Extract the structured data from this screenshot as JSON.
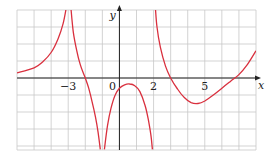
{
  "chart_data": {
    "type": "line",
    "title": "",
    "xlabel": "x",
    "ylabel": "y",
    "xlim": [
      -6,
      8
    ],
    "ylim": [
      -4.2,
      4
    ],
    "grid": true,
    "grid_step": 1,
    "x_tick_labels": [
      {
        "value": -3,
        "label": "−3"
      },
      {
        "value": 0,
        "label": "0"
      },
      {
        "value": 2,
        "label": "2"
      },
      {
        "value": 5,
        "label": "5"
      }
    ],
    "vertical_asymptotes": [
      -3,
      -1,
      2
    ],
    "series": [
      {
        "name": "left-branch",
        "points": [
          [
            -6,
            0.3
          ],
          [
            -5,
            0.6
          ],
          [
            -4.5,
            0.95
          ],
          [
            -4,
            1.5
          ],
          [
            -3.6,
            2.3
          ],
          [
            -3.3,
            3.2
          ],
          [
            -3.1,
            4.2
          ]
        ]
      },
      {
        "name": "middle-branch",
        "points": [
          [
            -2.85,
            4.2
          ],
          [
            -2.7,
            2.7
          ],
          [
            -2.5,
            1.6
          ],
          [
            -2.3,
            0.8
          ],
          [
            -2.1,
            0.25
          ],
          [
            -2.0,
            0.0
          ],
          [
            -1.8,
            -0.6
          ],
          [
            -1.6,
            -1.4
          ],
          [
            -1.4,
            -2.3
          ],
          [
            -1.25,
            -3.2
          ],
          [
            -1.12,
            -4.2
          ]
        ]
      },
      {
        "name": "center-hump",
        "points": [
          [
            -0.88,
            -4.2
          ],
          [
            -0.7,
            -2.8
          ],
          [
            -0.5,
            -1.8
          ],
          [
            -0.25,
            -1.0
          ],
          [
            0,
            -0.6
          ],
          [
            0.3,
            -0.4
          ],
          [
            0.6,
            -0.35
          ],
          [
            0.9,
            -0.45
          ],
          [
            1.2,
            -0.8
          ],
          [
            1.5,
            -1.6
          ],
          [
            1.7,
            -2.5
          ],
          [
            1.85,
            -3.4
          ],
          [
            1.93,
            -4.2
          ]
        ]
      },
      {
        "name": "right-branch",
        "points": [
          [
            2.1,
            4.2
          ],
          [
            2.2,
            3.0
          ],
          [
            2.4,
            1.8
          ],
          [
            2.7,
            0.7
          ],
          [
            3.0,
            0.0
          ],
          [
            3.4,
            -0.65
          ],
          [
            3.8,
            -1.15
          ],
          [
            4.2,
            -1.45
          ],
          [
            4.6,
            -1.5
          ],
          [
            5.0,
            -1.35
          ],
          [
            5.5,
            -1.0
          ],
          [
            6.0,
            -0.6
          ],
          [
            6.5,
            -0.2
          ],
          [
            7.0,
            0.2
          ],
          [
            7.5,
            0.8
          ],
          [
            8.0,
            1.6
          ]
        ]
      }
    ]
  },
  "colors": {
    "curve": "#d9303e",
    "grid": "#c8c8c8",
    "axis": "#222222"
  }
}
